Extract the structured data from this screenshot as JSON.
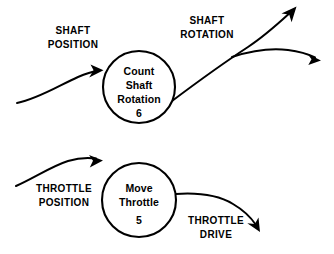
{
  "diagram": {
    "type": "data-flow-diagram",
    "background_color": "#ffffff",
    "line_color": "#000000",
    "processes": [
      {
        "id": "count-shaft-rotation",
        "lines": [
          "Count",
          "Shaft",
          "Rotation"
        ],
        "line1": "Count",
        "line2": "Shaft",
        "line3": "Rotation",
        "number": "6",
        "cx": 139,
        "cy": 87,
        "r": 36
      },
      {
        "id": "move-throttle",
        "lines": [
          "Move",
          "Throttle"
        ],
        "line1": "Move",
        "line2": "Throttle",
        "number": "5",
        "cx": 139,
        "cy": 200,
        "r": 37
      }
    ],
    "flows": [
      {
        "id": "shaft-position",
        "line1": "SHAFT",
        "line2": "POSITION",
        "direction": "input",
        "target": "count-shaft-rotation"
      },
      {
        "id": "shaft-rotation",
        "line1": "SHAFT",
        "line2": "ROTATION",
        "direction": "output",
        "source": "count-shaft-rotation",
        "branches": 2
      },
      {
        "id": "throttle-position",
        "line1": "THROTTLE",
        "line2": "POSITION",
        "direction": "input",
        "target": "move-throttle"
      },
      {
        "id": "throttle-drive",
        "line1": "THROTTLE",
        "line2": "DRIVE",
        "direction": "output",
        "source": "move-throttle"
      }
    ]
  }
}
